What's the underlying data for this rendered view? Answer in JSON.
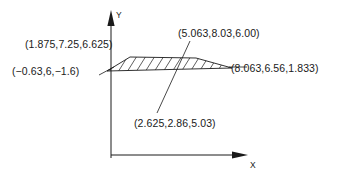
{
  "figure": {
    "type": "technical-line-drawing",
    "background_color": "#ffffff",
    "stroke_color": "#1a1a1a",
    "axes": {
      "y_axis_label": "Y",
      "x_axis_label": "X",
      "origin_x": 111,
      "origin_y": 155
    },
    "labels": {
      "top_left": "(1.875,7.25,6.625)",
      "left": "(−0.63,6,−1.6)",
      "top_right": "(5.063,8.03,6.00)",
      "right": "(8.063,6.56,1.833)",
      "bottom": "(2.625,2.86,5.03)"
    },
    "shape": {
      "name": "hatched-polygon",
      "fill": "none",
      "hatch_pattern": "diagonal-lines",
      "hatch_count": 13,
      "vertices": [
        [
          107,
          71
        ],
        [
          130,
          57
        ],
        [
          196,
          58
        ],
        [
          232,
          68
        ]
      ]
    },
    "leaders": [
      {
        "name": "left-leader",
        "from": [
          100,
          74
        ],
        "to": [
          113,
          67
        ]
      },
      {
        "name": "right-leader",
        "from": [
          232,
          68
        ],
        "to": [
          229,
          67
        ]
      },
      {
        "name": "diagonal-leader",
        "from": [
          190,
          41
        ],
        "to": [
          157,
          113
        ]
      }
    ]
  }
}
